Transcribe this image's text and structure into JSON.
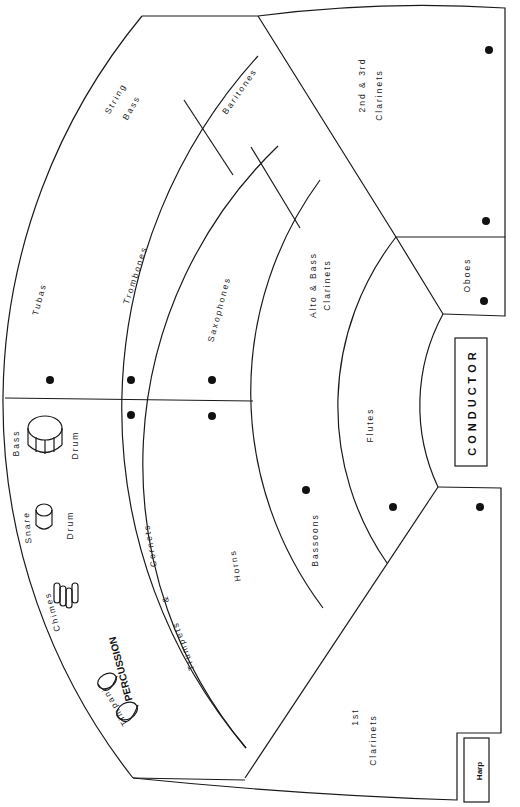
{
  "conductor": {
    "label": "CONDUCTOR"
  },
  "harp": {
    "label": "Harp"
  },
  "percussion": {
    "heading": "PERCUSSION",
    "instruments": [
      "Timpani",
      "Chimes",
      "Snare",
      "Drum",
      "Bass",
      "Drum"
    ]
  },
  "sections": {
    "tubas": "Tubas",
    "string_bass_1": "String",
    "string_bass_2": "Bass",
    "trombones": "Trombones",
    "baritones": "Baritones",
    "saxophones": "Saxophones",
    "alto_bass_1": "Alto  &  Bass",
    "alto_bass_2": "Clarinets",
    "clar23_1": "2nd  &  3rd",
    "clar23_2": "Clarinets",
    "oboes": "Oboes",
    "flutes": "Flutes",
    "bassoons": "Bassoons",
    "horns": "Horns",
    "trumpets": "Trumpets",
    "amp": "&",
    "cornets": "Cornets",
    "clar1_1": "1st",
    "clar1_2": "Clarinets"
  },
  "colors": {
    "line": "#1a1a1a",
    "background": "#ffffff"
  }
}
